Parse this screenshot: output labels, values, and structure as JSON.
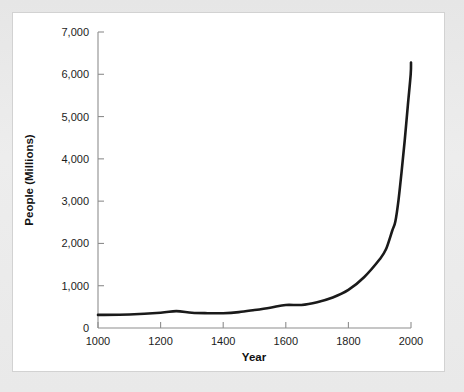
{
  "chart_data": {
    "type": "line",
    "title": "",
    "subtitle": "",
    "xlabel": "Year",
    "ylabel": "People (Millions)",
    "xlim": [
      1000,
      2000
    ],
    "ylim": [
      0,
      7000
    ],
    "grid": false,
    "legend": "none",
    "x_ticks": [
      "1000",
      "1200",
      "1400",
      "1600",
      "1800",
      "2000"
    ],
    "x_tick_values": [
      1000,
      1200,
      1400,
      1600,
      1800,
      2000
    ],
    "y_ticks": [
      "0",
      "1,000",
      "2,000",
      "3,000",
      "4,000",
      "5,000",
      "6,000",
      "7,000"
    ],
    "y_tick_values": [
      0,
      1000,
      2000,
      3000,
      4000,
      5000,
      6000,
      7000
    ],
    "series": [
      {
        "name": "World population",
        "color": "#1a1a1a",
        "x": [
          1000,
          1100,
          1200,
          1250,
          1300,
          1350,
          1400,
          1450,
          1500,
          1550,
          1600,
          1650,
          1700,
          1750,
          1800,
          1850,
          1900,
          1920,
          1940,
          1950,
          1960,
          1970,
          1980,
          1990,
          1999,
          2000
        ],
        "y": [
          310,
          320,
          360,
          400,
          360,
          350,
          350,
          375,
          425,
          480,
          545,
          545,
          610,
          720,
          900,
          1200,
          1625,
          1860,
          2300,
          2520,
          3020,
          3700,
          4440,
          5270,
          6000,
          6280
        ]
      }
    ],
    "annotations": []
  },
  "figure": {
    "background_color": "#e9e9e9",
    "panel_color": "#ffffff",
    "axis_color": "#8e8e8e",
    "curve_color": "#1a1a1a"
  }
}
